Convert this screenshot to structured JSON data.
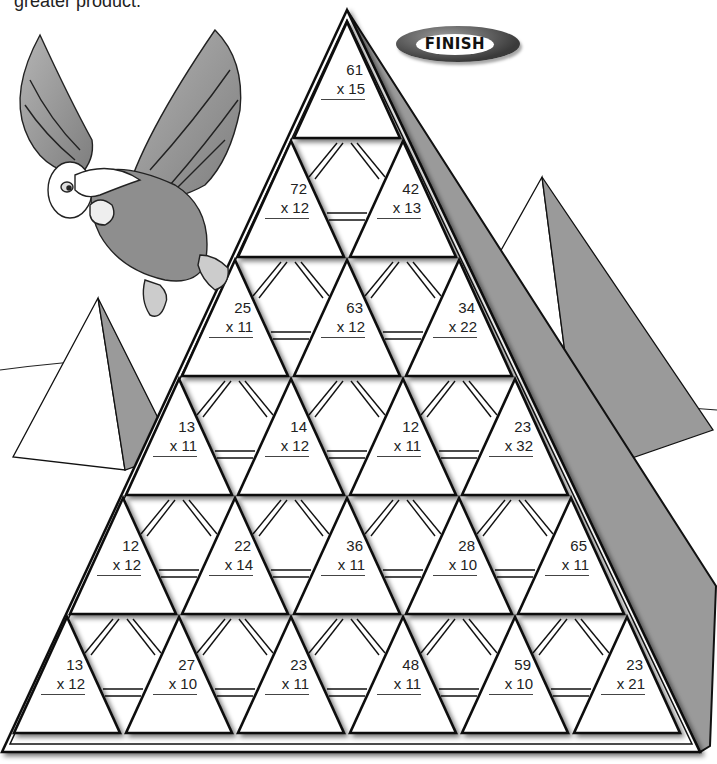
{
  "instructions": {
    "partial_text": "greater product."
  },
  "finish_badge": {
    "label": "FINISH"
  },
  "colors": {
    "stone_gray": "#9a9a9a",
    "outline": "#111111",
    "triangle_fill": "#ffffff"
  },
  "pyramid": {
    "rows": [
      {
        "row": 1,
        "problems": [
          {
            "top": "61",
            "bottom": "x 15"
          }
        ]
      },
      {
        "row": 2,
        "problems": [
          {
            "top": "72",
            "bottom": "x 12"
          },
          {
            "top": "42",
            "bottom": "x 13"
          }
        ]
      },
      {
        "row": 3,
        "problems": [
          {
            "top": "25",
            "bottom": "x 11"
          },
          {
            "top": "63",
            "bottom": "x 12"
          },
          {
            "top": "34",
            "bottom": "x 22"
          }
        ]
      },
      {
        "row": 4,
        "problems": [
          {
            "top": "13",
            "bottom": "x 11"
          },
          {
            "top": "14",
            "bottom": "x 12"
          },
          {
            "top": "12",
            "bottom": "x 11"
          },
          {
            "top": "23",
            "bottom": "x 32"
          }
        ]
      },
      {
        "row": 5,
        "problems": [
          {
            "top": "12",
            "bottom": "x 12"
          },
          {
            "top": "22",
            "bottom": "x 14"
          },
          {
            "top": "36",
            "bottom": "x 11"
          },
          {
            "top": "28",
            "bottom": "x 10"
          },
          {
            "top": "65",
            "bottom": "x 11"
          }
        ]
      },
      {
        "row": 6,
        "problems": [
          {
            "top": "13",
            "bottom": "x 12"
          },
          {
            "top": "27",
            "bottom": "x 10"
          },
          {
            "top": "23",
            "bottom": "x 11"
          },
          {
            "top": "48",
            "bottom": "x 11"
          },
          {
            "top": "59",
            "bottom": "x 10"
          },
          {
            "top": "23",
            "bottom": "x 21"
          }
        ]
      }
    ]
  },
  "illustrations": {
    "bird": "vulture-character",
    "background": "desert-pyramids"
  }
}
